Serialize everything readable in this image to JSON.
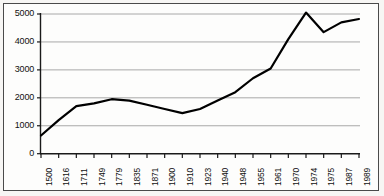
{
  "chart_data": {
    "type": "line",
    "title": "",
    "subtitle": "",
    "xlabel": "",
    "ylabel": "",
    "categories": [
      "1500",
      "1616",
      "1711",
      "1749",
      "1779",
      "1835",
      "1871",
      "1900",
      "1910",
      "1923",
      "1940",
      "1948",
      "1955",
      "1961",
      "1970",
      "1974",
      "1975",
      "1987",
      "1989"
    ],
    "values": [
      650,
      1200,
      1700,
      1800,
      1950,
      1900,
      1750,
      1600,
      1450,
      1600,
      1900,
      2200,
      2700,
      3050,
      4100,
      5050,
      4350,
      4700,
      4820
    ],
    "series": [
      {
        "name": "value",
        "values": [
          650,
          1200,
          1700,
          1800,
          1950,
          1900,
          1750,
          1600,
          1450,
          1600,
          1900,
          2200,
          2700,
          3050,
          4100,
          5050,
          4350,
          4700,
          4820
        ]
      }
    ],
    "yticks": [
      0,
      1000,
      2000,
      3000,
      4000,
      5000
    ],
    "ytick_labels": [
      "0",
      "1000",
      "2000",
      "3000",
      "4000",
      "5000"
    ],
    "ylim": [
      0,
      5000
    ],
    "grid": "horizontal",
    "legend": "none",
    "line_color": "#000000",
    "grid_color": "#a8a8a8",
    "axis_color": "#1a1a1a",
    "background_color": "#fdfdfc",
    "border_color": "#4a4a4a"
  }
}
